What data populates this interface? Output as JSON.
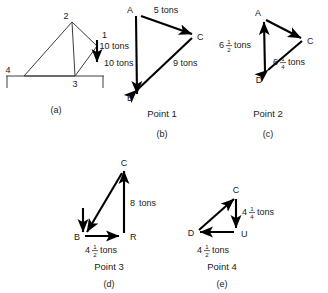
{
  "figure": {
    "panels": [
      {
        "id": "a",
        "caption": "(a)",
        "type": "truss-diagram",
        "point_label": "",
        "node_labels": [
          "1",
          "2",
          "3",
          "4"
        ],
        "load_label": "10 tons",
        "load_direction": "down"
      },
      {
        "id": "b",
        "caption": "(b)",
        "type": "force-polygon",
        "point_label": "Point 1",
        "node_labels": [
          "A",
          "B",
          "C"
        ],
        "vectors": [
          {
            "from": "A",
            "to": "C",
            "label": "5 tons"
          },
          {
            "from": "C",
            "to": "B",
            "label": "9 tons"
          },
          {
            "from": "A",
            "to": "B",
            "label": "10 tons"
          }
        ]
      },
      {
        "id": "c",
        "caption": "(c)",
        "type": "force-polygon",
        "point_label": "Point 2",
        "node_labels": [
          "A",
          "C",
          "D"
        ],
        "vectors": [
          {
            "from": "A",
            "to": "C",
            "label_whole": "6",
            "label_num": "1",
            "label_den": "4",
            "label_unit": "tons"
          },
          {
            "from": "D",
            "to": "A",
            "label_whole": "6",
            "label_num": "1",
            "label_den": "2",
            "label_unit": "tons"
          }
        ],
        "left_label": {
          "whole": "6",
          "num": "1",
          "den": "2",
          "unit": "tons"
        },
        "right_label": {
          "whole": "6",
          "num": "1",
          "den": "4",
          "unit": "tons"
        }
      },
      {
        "id": "d",
        "caption": "(d)",
        "type": "force-polygon",
        "point_label": "Point 3",
        "node_labels": [
          "B",
          "C",
          "R"
        ],
        "right_label": {
          "whole": "8",
          "num": "",
          "den": "",
          "unit": "tons"
        },
        "bottom_label": {
          "whole": "4",
          "num": "1",
          "den": "2",
          "unit": "tons"
        }
      },
      {
        "id": "e",
        "caption": "(e)",
        "type": "force-polygon",
        "point_label": "Point 4",
        "node_labels": [
          "C",
          "D",
          "U"
        ],
        "right_label": {
          "whole": "4",
          "num": "1",
          "den": "4",
          "unit": "tons"
        },
        "bottom_label": {
          "whole": "4",
          "num": "1",
          "den": "2",
          "unit": "tons"
        }
      }
    ],
    "colors": {
      "ink": "#1a1a1a",
      "member": "#3c3c3c",
      "vector": "#000000",
      "background": "#ffffff"
    }
  }
}
